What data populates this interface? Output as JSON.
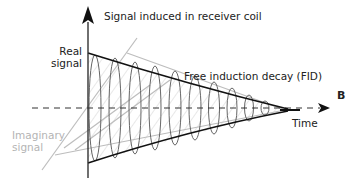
{
  "figure": {
    "panel_label": "B",
    "y_axis_label": "Signal induced in receiver coil",
    "x_axis_label": "Time",
    "real_signal_label": [
      "Real",
      "signal"
    ],
    "imaginary_signal_label": [
      "Imaginary",
      "signal"
    ],
    "fid_label": "Free induction decay (FID)"
  },
  "colors": {
    "axis": "#222222",
    "real_envelope": "#111111",
    "oscillation": "#555555",
    "imaginary": "#bdbdbd",
    "hatch": "#cfcfcf",
    "label_gray": "#b4b4b4"
  }
}
